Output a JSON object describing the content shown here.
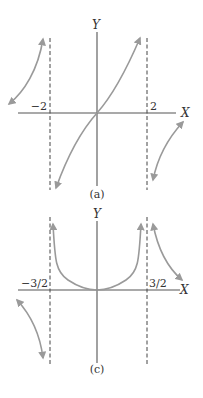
{
  "figure": {
    "panels": [
      {
        "id": "a",
        "caption": "(a)",
        "x_axis_label": "X",
        "y_axis_label": "Y",
        "tick_labels": [
          "−2",
          "2"
        ],
        "asymptotes": [
          -2,
          2
        ],
        "description": "Odd function with vertical asymptotes at x = −2 and x = 2, passing through the origin"
      },
      {
        "id": "c",
        "caption": "(c)",
        "x_axis_label": "X",
        "y_axis_label": "Y",
        "tick_labels": [
          "−3/2",
          "3/2"
        ],
        "asymptotes": [
          -1.5,
          1.5
        ],
        "description": "Even function with vertical asymptotes at x = −3/2 and x = 3/2, minimum at origin touching the X-axis"
      }
    ],
    "colors": {
      "axis": "#555555",
      "curve": "#9a9a9a",
      "text": "#333333"
    }
  }
}
